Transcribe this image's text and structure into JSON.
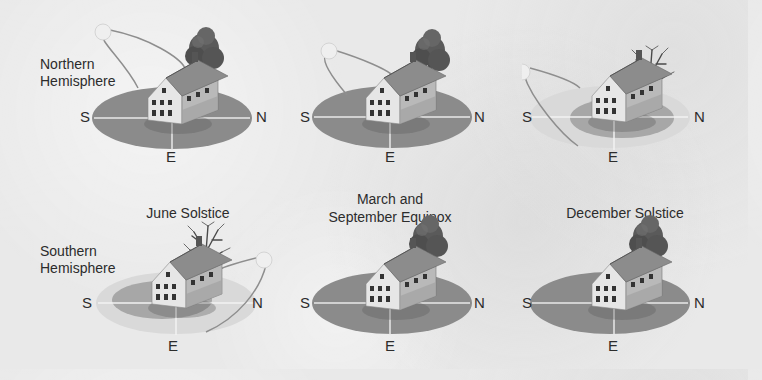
{
  "hemispheres": {
    "northern": {
      "line1": "Northern",
      "line2": "Hemisphere"
    },
    "southern": {
      "line1": "Southern",
      "line2": "Hemisphere"
    }
  },
  "captions": {
    "june": "June Solstice",
    "equinox_line1": "March and",
    "equinox_line2": "September Equinox",
    "december": "December Solstice"
  },
  "compass": {
    "south": "S",
    "north": "N",
    "east": "E"
  },
  "panels": [
    {
      "row": "northern",
      "season": "June Solstice",
      "sun_side": "south",
      "sun_height": "high",
      "ground": "dark",
      "tree": "leafy"
    },
    {
      "row": "northern",
      "season": "March and September Equinox",
      "sun_side": "south",
      "sun_height": "medium",
      "ground": "dark",
      "tree": "leafy"
    },
    {
      "row": "northern",
      "season": "December Solstice",
      "sun_side": "south",
      "sun_height": "low",
      "ground": "light",
      "tree": "bare"
    },
    {
      "row": "southern",
      "season": "June Solstice",
      "sun_side": "north",
      "sun_height": "low",
      "ground": "light",
      "tree": "bare"
    },
    {
      "row": "southern",
      "season": "March and September Equinox",
      "sun_side": "none",
      "ground": "dark",
      "tree": "leafy"
    },
    {
      "row": "southern",
      "season": "December Solstice",
      "sun_side": "none",
      "ground": "dark",
      "tree": "leafy"
    }
  ],
  "colors": {
    "ground_dark": "#8b8b8b",
    "ground_light": "#d9d9d9",
    "sun": "#eeeeee",
    "path": "#8e8e8e"
  }
}
